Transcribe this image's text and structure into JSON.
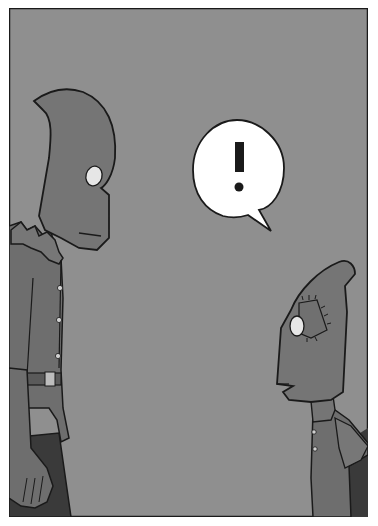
{
  "comic": {
    "panel_count": 1,
    "speech_bubble": {
      "text": "!"
    },
    "colors": {
      "background": "#8f8f8f",
      "character_fill": "#757575",
      "shirt_fill": "#6e6e6e",
      "dark": "#3a3a3a",
      "outline": "#1a1a1a",
      "eye": "#e8e8e8",
      "bubble": "#ffffff",
      "page": "#ffffff"
    },
    "characters": [
      {
        "name": "tall-hooded-figure",
        "position": "left"
      },
      {
        "name": "small-hooded-figure-with-patch",
        "position": "right"
      }
    ]
  }
}
